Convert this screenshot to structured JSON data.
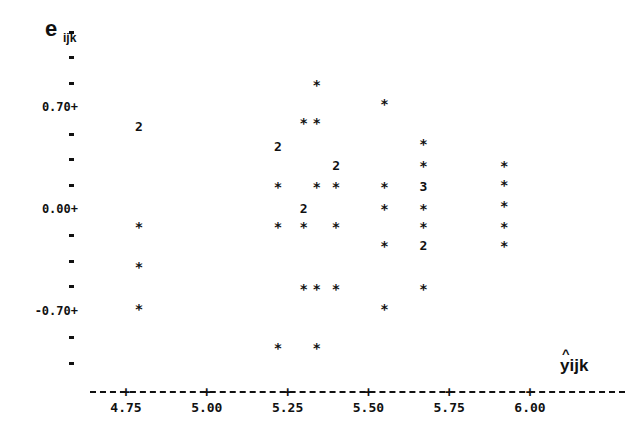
{
  "chart_data": {
    "type": "scatter",
    "title": "",
    "xlabel": "ŷijk",
    "ylabel": "eijk",
    "xlim": [
      4.7,
      6.1
    ],
    "ylim": [
      -1.15,
      1.0
    ],
    "grid": false,
    "legend": "none",
    "x_ticks": [
      4.75,
      5.0,
      5.25,
      5.5,
      5.75,
      6.0
    ],
    "x_tick_labels": [
      "4.75",
      "5.00",
      "5.25",
      "5.50",
      "5.75",
      "6.00"
    ],
    "y_ticks": [
      0.7,
      0.0,
      -0.7
    ],
    "y_tick_labels": [
      "0.70+",
      "0.00+",
      "-0.70+"
    ],
    "y_minor_tick_step": 0.175,
    "marker_note": "* = one observation; digit = number of coincident observations",
    "points": [
      {
        "x": 4.79,
        "y": 0.57,
        "count": 2
      },
      {
        "x": 4.79,
        "y": -0.12,
        "count": 1
      },
      {
        "x": 4.79,
        "y": -0.39,
        "count": 1
      },
      {
        "x": 4.79,
        "y": -0.68,
        "count": 1
      },
      {
        "x": 5.22,
        "y": 0.43,
        "count": 2
      },
      {
        "x": 5.22,
        "y": 0.16,
        "count": 1
      },
      {
        "x": 5.22,
        "y": -0.12,
        "count": 1
      },
      {
        "x": 5.22,
        "y": -0.95,
        "count": 1
      },
      {
        "x": 5.3,
        "y": 0.6,
        "count": 1
      },
      {
        "x": 5.3,
        "y": 0.01,
        "count": 2
      },
      {
        "x": 5.3,
        "y": -0.12,
        "count": 1
      },
      {
        "x": 5.3,
        "y": -0.54,
        "count": 1
      },
      {
        "x": 5.34,
        "y": 0.86,
        "count": 1
      },
      {
        "x": 5.34,
        "y": 0.6,
        "count": 1
      },
      {
        "x": 5.34,
        "y": 0.16,
        "count": 1
      },
      {
        "x": 5.34,
        "y": -0.54,
        "count": 1
      },
      {
        "x": 5.34,
        "y": -0.95,
        "count": 1
      },
      {
        "x": 5.4,
        "y": 0.3,
        "count": 2
      },
      {
        "x": 5.4,
        "y": 0.16,
        "count": 1
      },
      {
        "x": 5.4,
        "y": -0.12,
        "count": 1
      },
      {
        "x": 5.4,
        "y": -0.54,
        "count": 1
      },
      {
        "x": 5.55,
        "y": 0.73,
        "count": 1
      },
      {
        "x": 5.55,
        "y": 0.16,
        "count": 1
      },
      {
        "x": 5.55,
        "y": 0.01,
        "count": 1
      },
      {
        "x": 5.55,
        "y": -0.25,
        "count": 1
      },
      {
        "x": 5.55,
        "y": -0.68,
        "count": 1
      },
      {
        "x": 5.67,
        "y": 0.45,
        "count": 1
      },
      {
        "x": 5.67,
        "y": 0.3,
        "count": 1
      },
      {
        "x": 5.67,
        "y": 0.16,
        "count": 3
      },
      {
        "x": 5.67,
        "y": 0.01,
        "count": 1
      },
      {
        "x": 5.67,
        "y": -0.12,
        "count": 1
      },
      {
        "x": 5.67,
        "y": -0.25,
        "count": 2
      },
      {
        "x": 5.67,
        "y": -0.54,
        "count": 1
      },
      {
        "x": 5.92,
        "y": 0.3,
        "count": 1
      },
      {
        "x": 5.92,
        "y": 0.17,
        "count": 1
      },
      {
        "x": 5.92,
        "y": 0.03,
        "count": 1
      },
      {
        "x": 5.92,
        "y": -0.12,
        "count": 1
      },
      {
        "x": 5.92,
        "y": -0.25,
        "count": 1
      }
    ]
  },
  "axes": {
    "y_label_main": "e",
    "y_label_sub": "ijk",
    "x_label_hat": "^",
    "x_label": "yijk"
  }
}
